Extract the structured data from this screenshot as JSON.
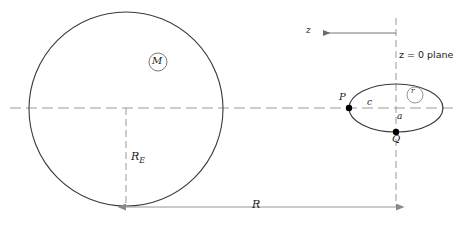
{
  "figure": {
    "canvas": {
      "width": 458,
      "height": 239
    },
    "colors": {
      "stroke": "#3a3a3a",
      "dashed": "#9a9a9a",
      "dimension": "#8a8a8a",
      "text": "#1a1a1a",
      "background": "#ffffff",
      "marker_fill": "#000000"
    }
  },
  "labels": {
    "central_mass": "M",
    "body_radius": "R",
    "body_radius_sub": "E",
    "orbit_distance": "R",
    "z_axis": "z",
    "z_plane": "z = 0 plane",
    "point_p": "P",
    "point_q": "Q",
    "semi_axis_c": "c",
    "semi_axis_a": "a",
    "inner_radius": "r"
  },
  "geometry": {
    "big_circle": {
      "cx": 126,
      "cy": 109,
      "r": 97
    },
    "mass_marker": {
      "cx": 158,
      "cy": 62,
      "r": 9
    },
    "ellipse": {
      "cx": 396,
      "cy": 108,
      "rx": 47,
      "ry": 24
    },
    "inner_circle": {
      "cx": 415,
      "cy": 95,
      "r": 8
    },
    "point_p": {
      "x": 349,
      "y": 108
    },
    "point_q": {
      "x": 396,
      "y": 132
    },
    "horizontal_axis_y": 108,
    "vertical_plane_x": 396,
    "radius_line_x": 126,
    "dimension_line_y": 207,
    "z_arrow": {
      "from_x": 396,
      "to_x": 323,
      "y": 33
    }
  }
}
